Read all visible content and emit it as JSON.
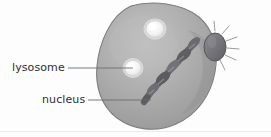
{
  "figure": {
    "background_color": "#fdfdfd",
    "labels": [
      {
        "id": "lysosome",
        "text": "lysosome"
      },
      {
        "id": "nucleus",
        "text": "nucleus"
      }
    ],
    "leader_lines": [
      {
        "id": "lysosome-leader",
        "x1": 68,
        "y1": 68,
        "x2": 133,
        "y2": 68,
        "color": "#6a6a6c"
      },
      {
        "id": "nucleus-leader",
        "x1": 88,
        "y1": 100,
        "x2": 151,
        "y2": 100,
        "color": "#6a6a6c"
      }
    ],
    "structures": [
      {
        "id": "cell-body",
        "name": "cell-body",
        "fill": "#a8a8a8",
        "stroke": "#7d7d7d"
      },
      {
        "id": "vesicle-upper",
        "name": "lysosome-vesicle-upper",
        "cx": 155,
        "cy": 29,
        "rx": 11,
        "ry": 10,
        "fill": "#f2f2f2",
        "stroke": "#d8d8d8"
      },
      {
        "id": "vesicle-lower",
        "name": "lysosome-vesicle-lower",
        "cx": 133,
        "cy": 68,
        "rx": 10,
        "ry": 9.5,
        "fill": "#f2f2f2",
        "stroke": "#d8d8d8"
      },
      {
        "id": "nucleus-coil",
        "name": "nucleus-coiled-chromatin",
        "fill": "#6f6f73",
        "stroke": "#4e4e52"
      },
      {
        "id": "centrosome",
        "name": "centrosome-aster",
        "cx": 215,
        "cy": 47,
        "rx": 11,
        "ry": 14,
        "fill": "#75757b",
        "stroke": "#54545a",
        "ray_count": 11,
        "ray_color": "#8b8b90"
      }
    ],
    "baseline_rule": {
      "id": "bottom-rule",
      "y": 131,
      "color": "#e6e6e6"
    }
  }
}
